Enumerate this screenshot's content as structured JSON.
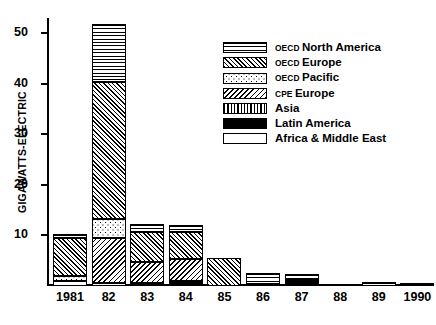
{
  "chart_data": {
    "type": "bar",
    "subtype": "stacked",
    "title": "",
    "xlabel": "",
    "ylabel": "GIGAWATTS-ELECTRIC",
    "ylim": [
      0,
      53
    ],
    "yticks": [
      10,
      20,
      30,
      40,
      50
    ],
    "grid": false,
    "legend_position": "upper-right",
    "categories": [
      "1981",
      "82",
      "83",
      "84",
      "85",
      "86",
      "87",
      "88",
      "89",
      "1990"
    ],
    "series": [
      {
        "name": "OECD North America",
        "pattern": "horizontal-lines",
        "values": [
          0.9,
          11.4,
          1.6,
          1.4,
          0.0,
          2.2,
          1.0,
          0.0,
          0.7,
          0.0
        ]
      },
      {
        "name": "OECD Europe",
        "pattern": "diagonal-ne-dense",
        "values": [
          7.4,
          27.1,
          6.0,
          5.4,
          5.6,
          0.0,
          0.0,
          0.0,
          0.0,
          0.0
        ]
      },
      {
        "name": "OECD Pacific",
        "pattern": "dots",
        "values": [
          1.1,
          3.8,
          0.0,
          0.0,
          0.0,
          0.0,
          0.0,
          0.0,
          0.0,
          0.0
        ]
      },
      {
        "name": "CPE Europe",
        "pattern": "diagonal-nw",
        "values": [
          0.0,
          8.9,
          4.1,
          4.3,
          0.0,
          0.0,
          0.0,
          0.0,
          0.0,
          0.0
        ]
      },
      {
        "name": "Asia",
        "pattern": "vertical-lines",
        "values": [
          0.0,
          0.0,
          0.0,
          0.0,
          0.0,
          0.0,
          0.0,
          0.0,
          0.0,
          0.0
        ]
      },
      {
        "name": "Latin America",
        "pattern": "solid-black",
        "values": [
          0.0,
          0.0,
          0.6,
          0.6,
          0.0,
          0.4,
          1.3,
          0.0,
          0.0,
          0.5
        ]
      },
      {
        "name": "Africa & Middle East",
        "pattern": "white",
        "values": [
          0.9,
          0.6,
          0.0,
          0.4,
          0.0,
          0.0,
          0.0,
          0.0,
          0.0,
          0.0
        ]
      }
    ],
    "totals": [
      10.3,
      51.8,
      12.3,
      12.1,
      5.6,
      2.6,
      2.3,
      0.0,
      0.7,
      0.5
    ]
  },
  "axes": {
    "y_title": "GIGAWATTS-ELECTRIC",
    "y_tick_labels": [
      "10",
      "20",
      "30",
      "40",
      "50"
    ],
    "x_tick_labels": [
      "1981",
      "82",
      "83",
      "84",
      "85",
      "86",
      "87",
      "88",
      "89",
      "1990"
    ]
  },
  "legend": {
    "items": [
      {
        "prefix": "OECD",
        "label": "North America",
        "swatch": "horizontal-lines-swatch"
      },
      {
        "prefix": "OECD",
        "label": "Europe",
        "swatch": "diagonal-ne-dense-swatch"
      },
      {
        "prefix": "OECD",
        "label": "Pacific",
        "swatch": "dots-swatch"
      },
      {
        "prefix": "CPE",
        "label": "Europe",
        "swatch": "diagonal-nw-swatch"
      },
      {
        "prefix": "",
        "label": "Asia",
        "swatch": "vertical-lines-swatch"
      },
      {
        "prefix": "",
        "label": "Latin America",
        "swatch": "solid-black-swatch"
      },
      {
        "prefix": "",
        "label": "Africa & Middle East",
        "swatch": "white-swatch"
      }
    ]
  },
  "colors": {
    "ink": "#000000",
    "paper": "#ffffff"
  }
}
